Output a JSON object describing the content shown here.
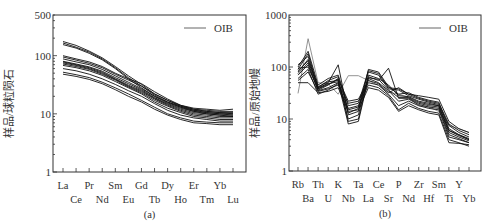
{
  "figure": {
    "panels": [
      {
        "id": "a",
        "caption": "(a)",
        "ylabel": "样品/球粒陨石",
        "legend": "OIB",
        "frame": {
          "left": 53,
          "right": 246,
          "top": 15,
          "bottom": 172
        },
        "ylim": [
          1,
          500
        ],
        "yticks": [
          {
            "v": 1,
            "label": "1"
          },
          {
            "v": 10,
            "label": "10"
          },
          {
            "v": 100,
            "label": "100"
          },
          {
            "v": 500,
            "label": "500"
          }
        ],
        "x_first": 63,
        "x_last": 233,
        "label_rows": [
          [
            "La",
            "",
            "Pr",
            "",
            "",
            "Eu",
            "",
            "Tb",
            "",
            "Ho",
            "",
            "Tm",
            "",
            "Lu"
          ],
          [
            "",
            "Ce",
            "",
            "Nd",
            "Sm",
            "",
            "Gd",
            "",
            "Dy",
            "",
            "Er",
            "",
            "Yb",
            ""
          ]
        ]
      },
      {
        "id": "b",
        "caption": "(b)",
        "ylabel": "样品/原始地幔",
        "legend": "OIB",
        "frame": {
          "left": 289,
          "right": 481,
          "top": 15,
          "bottom": 171
        },
        "ylim": [
          1,
          1000
        ],
        "yticks": [
          {
            "v": 1,
            "label": "1"
          },
          {
            "v": 10,
            "label": "10"
          },
          {
            "v": 100,
            "label": "100"
          },
          {
            "v": 1000,
            "label": "1000"
          }
        ],
        "x_first": 298,
        "x_last": 469
      }
    ]
  },
  "chart_data": [
    {
      "type": "line",
      "title": "(a)",
      "xlabel": "",
      "ylabel": "样品/球粒陨石",
      "yscale": "log",
      "ylim": [
        1,
        500
      ],
      "grid": false,
      "legend": {
        "position": "upper right",
        "entries": [
          "OIB"
        ]
      },
      "categories": [
        "La",
        "Ce",
        "Pr",
        "Nd",
        "Sm",
        "Eu",
        "Gd",
        "Tb",
        "Dy",
        "Ho",
        "Er",
        "Tm",
        "Yb",
        "Lu"
      ],
      "series": [
        {
          "name": "s1",
          "values": [
            175,
            150,
            120,
            92,
            65,
            45,
            32,
            22,
            17,
            14,
            12.5,
            12,
            11.5,
            12
          ]
        },
        {
          "name": "s2",
          "values": [
            165,
            140,
            115,
            88,
            62,
            42,
            30,
            21,
            16,
            13.5,
            12,
            11.5,
            11,
            11
          ]
        },
        {
          "name": "s3",
          "values": [
            155,
            135,
            110,
            85,
            60,
            40,
            28,
            20,
            15.5,
            13,
            11.5,
            11,
            10.5,
            10.5
          ]
        },
        {
          "name": "s4",
          "values": [
            100,
            88,
            78,
            65,
            50,
            40,
            33,
            24,
            18,
            14,
            12,
            11,
            10.5,
            10
          ]
        },
        {
          "name": "s5",
          "values": [
            95,
            84,
            74,
            62,
            48,
            38,
            30,
            22,
            17,
            13.5,
            11.5,
            10.5,
            10,
            9.5
          ]
        },
        {
          "name": "s6",
          "values": [
            88,
            78,
            70,
            58,
            45,
            35,
            27,
            20,
            16,
            13,
            11,
            10.5,
            10,
            10
          ]
        },
        {
          "name": "s7",
          "values": [
            80,
            72,
            64,
            54,
            42,
            33,
            26,
            19,
            15,
            12.5,
            11,
            10,
            9.5,
            9.5
          ]
        },
        {
          "name": "s8",
          "values": [
            78,
            70,
            62,
            52,
            40,
            31,
            25,
            18.5,
            14.5,
            12,
            10.5,
            10,
            9.5,
            9
          ]
        },
        {
          "name": "s9",
          "values": [
            75,
            68,
            60,
            50,
            39,
            30,
            24,
            18,
            14,
            11.5,
            10,
            9.5,
            9,
            9
          ]
        },
        {
          "name": "s10",
          "values": [
            72,
            65,
            58,
            48,
            38,
            29,
            23,
            17,
            13.5,
            11,
            9.5,
            9,
            8.5,
            8.5
          ]
        },
        {
          "name": "s11",
          "values": [
            68,
            62,
            55,
            46,
            36,
            28,
            22,
            16,
            12.5,
            10.5,
            9,
            8.5,
            8,
            8
          ]
        },
        {
          "name": "s12",
          "values": [
            60,
            55,
            48,
            40,
            32,
            25,
            20,
            15,
            11.5,
            9.5,
            8.5,
            8,
            7.5,
            7.5
          ]
        },
        {
          "name": "s13",
          "values": [
            52,
            47,
            42,
            35,
            28,
            22,
            17,
            13,
            10,
            8.5,
            7.5,
            7.2,
            7,
            7
          ]
        },
        {
          "name": "s14",
          "values": [
            48,
            44,
            39,
            33,
            26,
            20,
            16,
            12,
            9.5,
            8,
            7,
            6.8,
            6.5,
            6.5
          ]
        }
      ]
    },
    {
      "type": "line",
      "title": "(b)",
      "xlabel": "",
      "ylabel": "样品/原始地幔",
      "yscale": "log",
      "ylim": [
        1,
        1000
      ],
      "grid": false,
      "legend": {
        "position": "upper right",
        "entries": [
          "OIB"
        ]
      },
      "categories": [
        "Rb",
        "Ba",
        "Th",
        "U",
        "K",
        "Nb",
        "Ta",
        "La",
        "Ce",
        "Sr",
        "P",
        "Nd",
        "Zr",
        "Hf",
        "Sm",
        "Ti",
        "Y",
        "Yb"
      ],
      "series": [
        {
          "name": "OIB",
          "values": [
            31,
            350,
            50,
            48,
            30,
            68,
            68,
            55,
            44,
            33,
            30,
            26,
            18,
            17,
            14,
            7.5,
            6.5,
            5.5
          ]
        },
        {
          "name": "s1",
          "values": [
            100,
            200,
            45,
            60,
            70,
            18,
            20,
            85,
            75,
            40,
            38,
            30,
            25,
            22,
            20,
            8,
            6,
            5
          ]
        },
        {
          "name": "s2",
          "values": [
            90,
            180,
            40,
            55,
            65,
            15,
            17,
            80,
            70,
            38,
            36,
            28,
            24,
            21,
            19,
            7.5,
            5.5,
            4.5
          ]
        },
        {
          "name": "s3",
          "values": [
            110,
            160,
            38,
            50,
            110,
            12,
            14,
            90,
            80,
            42,
            30,
            32,
            26,
            23,
            21,
            6.5,
            5,
            4
          ]
        },
        {
          "name": "s4",
          "values": [
            80,
            140,
            42,
            52,
            55,
            10,
            12,
            70,
            60,
            45,
            28,
            27,
            22,
            20,
            18,
            6,
            5,
            4.2
          ]
        },
        {
          "name": "s5",
          "values": [
            75,
            120,
            36,
            45,
            60,
            9,
            10,
            65,
            55,
            95,
            25,
            25,
            20,
            18,
            17,
            5.5,
            4.5,
            3.8
          ]
        },
        {
          "name": "s6",
          "values": [
            70,
            110,
            35,
            40,
            50,
            8,
            9,
            60,
            50,
            35,
            22,
            24,
            19,
            17,
            16,
            5,
            4.2,
            3.5
          ]
        },
        {
          "name": "s7",
          "values": [
            95,
            100,
            38,
            46,
            58,
            22,
            24,
            55,
            48,
            32,
            40,
            30,
            28,
            26,
            24,
            9,
            6.5,
            5.5
          ]
        },
        {
          "name": "s8",
          "values": [
            60,
            90,
            30,
            36,
            48,
            20,
            22,
            50,
            45,
            30,
            18,
            22,
            18,
            16,
            15,
            4.5,
            4,
            3.5
          ]
        },
        {
          "name": "s9",
          "values": [
            55,
            80,
            34,
            38,
            45,
            16,
            18,
            45,
            40,
            28,
            15,
            20,
            16,
            14,
            13,
            4,
            3.5,
            3
          ]
        },
        {
          "name": "s10",
          "values": [
            50,
            50,
            32,
            34,
            40,
            14,
            15,
            40,
            36,
            26,
            14,
            18,
            15,
            13,
            12,
            3.5,
            3.4,
            3.2
          ]
        },
        {
          "name": "s11",
          "values": [
            85,
            130,
            40,
            48,
            52,
            13,
            16,
            62,
            58,
            36,
            26,
            26,
            21,
            19,
            18,
            6,
            4.8,
            4
          ]
        }
      ]
    }
  ]
}
